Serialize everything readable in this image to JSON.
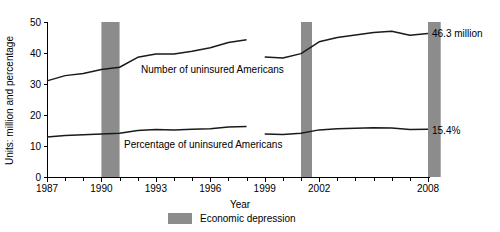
{
  "chart_data": {
    "type": "line",
    "title": "",
    "xlabel": "Year",
    "ylabel": "Units: million and percentage",
    "xlim": [
      1987,
      2008
    ],
    "ylim": [
      0,
      50
    ],
    "grid": false,
    "legend_position": "bottom-center",
    "y_ticks": [
      "0",
      "10",
      "20",
      "30",
      "40",
      "50"
    ],
    "y_tick_values": [
      0,
      10,
      20,
      30,
      40,
      50
    ],
    "x_ticks": [
      "1987",
      "1990",
      "1993",
      "1996",
      "1999",
      "2002",
      "2008"
    ],
    "x_tick_values": [
      1987,
      1990,
      1993,
      1996,
      1999,
      2002,
      2008
    ],
    "x_minor_tick_values": [
      1987,
      1988,
      1989,
      1990,
      1991,
      1992,
      1993,
      1994,
      1995,
      1996,
      1997,
      1998,
      1999,
      2000,
      2001,
      2002,
      2003,
      2004,
      2005,
      2006,
      2007,
      2008
    ],
    "series": [
      {
        "name": "Number of uninsured Americans",
        "unit": "million",
        "x": [
          1987,
          1988,
          1989,
          1990,
          1991,
          1992,
          1993,
          1994,
          1995,
          1996,
          1997,
          1998,
          1999,
          2000,
          2001,
          2002,
          2003,
          2004,
          2005,
          2006,
          2007,
          2008
        ],
        "values": [
          31.0,
          32.7,
          33.4,
          34.7,
          35.4,
          38.6,
          39.7,
          39.7,
          40.6,
          41.7,
          43.4,
          44.3,
          38.7,
          38.4,
          39.8,
          43.6,
          45.0,
          45.8,
          46.6,
          47.0,
          45.7,
          46.3
        ],
        "break_after_x": 1998,
        "break_resume_x": 1999
      },
      {
        "name": "Percentage of uninsured Americans",
        "unit": "percent",
        "x": [
          1987,
          1988,
          1989,
          1990,
          1991,
          1992,
          1993,
          1994,
          1995,
          1996,
          1997,
          1998,
          1999,
          2000,
          2001,
          2002,
          2003,
          2004,
          2005,
          2006,
          2007,
          2008
        ],
        "values": [
          12.9,
          13.4,
          13.6,
          13.9,
          14.1,
          15.0,
          15.3,
          15.2,
          15.4,
          15.6,
          16.1,
          16.3,
          13.9,
          13.7,
          14.1,
          15.2,
          15.6,
          15.7,
          15.9,
          15.8,
          15.3,
          15.4
        ],
        "break_after_x": 1998,
        "break_resume_x": 1999
      }
    ],
    "annotations": [
      {
        "name": "number-callout",
        "text": "46.3 million",
        "at_x": 2008,
        "at_y": 46.3
      },
      {
        "name": "percentage-callout",
        "text": "15.4%",
        "at_x": 2008,
        "at_y": 15.4
      }
    ],
    "inline_series_labels": [
      {
        "name": "number-series-label",
        "text": "Number of uninsured Americans"
      },
      {
        "name": "percentage-series-label",
        "text": "Percentage of uninsured Americans"
      }
    ],
    "shaded_bands": [
      {
        "name": "recession-1990",
        "start": 1990,
        "end": 1991,
        "label": "Economic depression"
      },
      {
        "name": "recession-2001",
        "start": 2001,
        "end": 2001.6,
        "label": "Economic depression"
      },
      {
        "name": "recession-2008",
        "start": 2008,
        "end": 2008.7,
        "label": "Economic depression"
      }
    ],
    "legend": [
      {
        "name": "economic-depression",
        "label": "Economic depression",
        "color": "#8c8c8c",
        "swatch": "filled-rectangle"
      }
    ],
    "colors": {
      "band": "#8c8c8c",
      "line": "#1a1a1a",
      "axis": "#000000",
      "background": "#ffffff"
    }
  }
}
